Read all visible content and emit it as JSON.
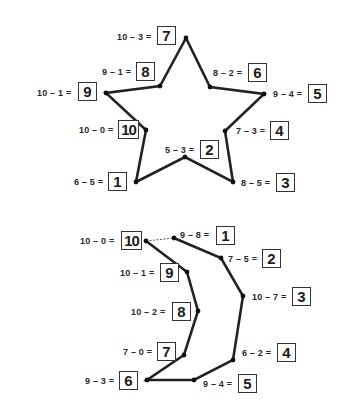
{
  "worksheet": {
    "line_color": "#222222",
    "puzzles": [
      {
        "name": "star",
        "points": [
          {
            "order": 1,
            "equation": "6 – 5 =",
            "answer": "1",
            "x": 136,
            "y": 182
          },
          {
            "order": 2,
            "equation": "5 – 3 =",
            "answer": "2",
            "x": 185,
            "y": 157
          },
          {
            "order": 3,
            "equation": "8 – 5 =",
            "answer": "3",
            "x": 233,
            "y": 182
          },
          {
            "order": 4,
            "equation": "7 – 3 =",
            "answer": "4",
            "x": 225,
            "y": 131
          },
          {
            "order": 5,
            "equation": "9 – 4 =",
            "answer": "5",
            "x": 264,
            "y": 94
          },
          {
            "order": 6,
            "equation": "8 – 2 =",
            "answer": "6",
            "x": 210,
            "y": 87
          },
          {
            "order": 7,
            "equation": "10 – 3 =",
            "answer": "7",
            "x": 186,
            "y": 38
          },
          {
            "order": 8,
            "equation": "9 – 1 =",
            "answer": "8",
            "x": 160,
            "y": 86
          },
          {
            "order": 9,
            "equation": "10 – 1 =",
            "answer": "9",
            "x": 106,
            "y": 93
          },
          {
            "order": 10,
            "equation": "10 – 0 =",
            "answer": "10",
            "x": 146,
            "y": 130
          }
        ]
      },
      {
        "name": "moon",
        "points": [
          {
            "order": 1,
            "equation": "9 – 8 =",
            "answer": "1",
            "x": 174,
            "y": 238
          },
          {
            "order": 2,
            "equation": "7 – 5 =",
            "answer": "2",
            "x": 221,
            "y": 258
          },
          {
            "order": 3,
            "equation": "10 – 7 =",
            "answer": "3",
            "x": 243,
            "y": 296
          },
          {
            "order": 4,
            "equation": "6 – 2 =",
            "answer": "4",
            "x": 233,
            "y": 360
          },
          {
            "order": 5,
            "equation": "9 – 4 =",
            "answer": "5",
            "x": 194,
            "y": 380
          },
          {
            "order": 6,
            "equation": "9 – 3 =",
            "answer": "6",
            "x": 147,
            "y": 380
          },
          {
            "order": 7,
            "equation": "7 – 0 =",
            "answer": "7",
            "x": 184,
            "y": 355
          },
          {
            "order": 8,
            "equation": "10 – 2 =",
            "answer": "8",
            "x": 198,
            "y": 311
          },
          {
            "order": 9,
            "equation": "10 – 1 =",
            "answer": "9",
            "x": 187,
            "y": 272
          },
          {
            "order": 10,
            "equation": "10 – 0 =",
            "answer": "10",
            "x": 146,
            "y": 241
          }
        ]
      }
    ]
  }
}
